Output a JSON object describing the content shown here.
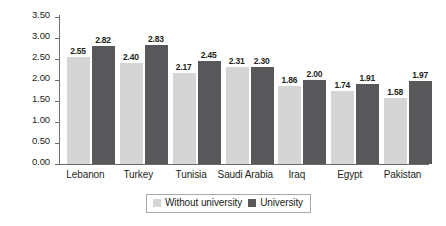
{
  "chart_data": {
    "type": "bar",
    "title": "",
    "subtitle": "",
    "xlabel": "",
    "ylabel": "",
    "categories": [
      "Lebanon",
      "Turkey",
      "Tunisia",
      "Saudi Arabia",
      "Iraq",
      "Egypt",
      "Pakistan"
    ],
    "series": [
      {
        "name": "Without university",
        "color": "#d5d5d5",
        "values": [
          2.55,
          2.4,
          2.17,
          2.31,
          1.86,
          1.74,
          1.58
        ],
        "labels": [
          "2.55",
          "2.40",
          "2.17",
          "2.31",
          "1.86",
          "1.74",
          "1.58"
        ]
      },
      {
        "name": "University",
        "color": "#58585a",
        "values": [
          2.82,
          2.83,
          2.45,
          2.3,
          2.0,
          1.91,
          1.97
        ],
        "labels": [
          "2.82",
          "2.83",
          "2.45",
          "2.30",
          "2.00",
          "1.91",
          "1.97"
        ]
      }
    ],
    "ylim": [
      0.0,
      3.5
    ],
    "ytick_values": [
      3.5,
      3.0,
      2.5,
      2.0,
      1.5,
      1.0,
      0.5,
      0.0
    ],
    "ytick_labels": [
      "3.50",
      "3.00",
      "2.50",
      "2.00",
      "1.50",
      "1.00",
      "0.50",
      "0.00"
    ],
    "grid": false,
    "legend_position": "bottom",
    "legend": [
      "Without university",
      "University"
    ]
  },
  "axis": {
    "line_color": "#6d6e71"
  },
  "legend": {
    "items": [
      {
        "label": "Without university",
        "swatch": "light"
      },
      {
        "label": "University",
        "swatch": "dark"
      }
    ]
  }
}
